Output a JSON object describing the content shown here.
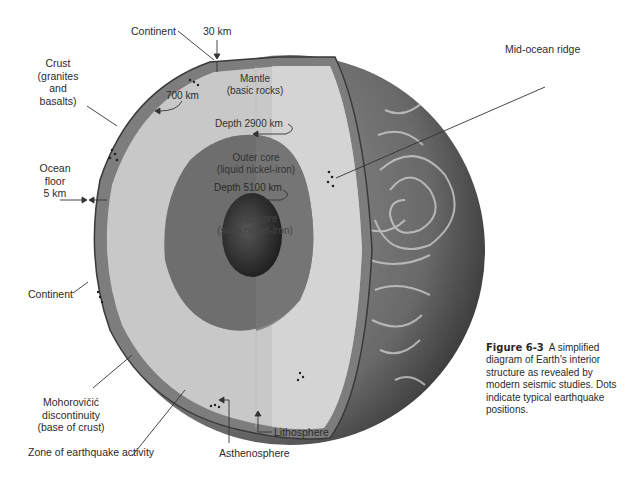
{
  "figure": {
    "number_label": "Figure 6-3",
    "caption_text": "A simplified diagram of Earth's interior structure as revealed by modern seismic studies. Dots indicate typical earthquake positions."
  },
  "labels": {
    "continent_top": "Continent",
    "depth_30": "30 km",
    "crust": [
      "Crust",
      "(granites",
      "and",
      "basalts)"
    ],
    "depth_700": "700 km",
    "mantle": [
      "Mantle",
      "(basic rocks)"
    ],
    "depth_2900": "Depth 2900 km",
    "mid_ocean_ridge": "Mid-ocean ridge",
    "ocean_floor": [
      "Ocean",
      "floor",
      "5 km"
    ],
    "outer_core": [
      "Outer core",
      "(liquid nickel-iron)"
    ],
    "depth_5100": "Depth 5100 km",
    "inner_core": [
      "Inner core",
      "(solid nickel-iron)"
    ],
    "continent_left": "Continent",
    "mohorovicic": [
      "Mohorovičić",
      "discontinuity",
      "(base of crust)"
    ],
    "lithosphere": "Lithosphere",
    "zone_earthquake": "Zone of earthquake activity",
    "asthenosphere": "Asthenosphere"
  },
  "colors": {
    "crust": "#7d7d7d",
    "mantle": "#c9c9c9",
    "outer_core": "#6e6e6e",
    "inner_core": "#2c2c2c",
    "surface": "#5a5a5a"
  }
}
